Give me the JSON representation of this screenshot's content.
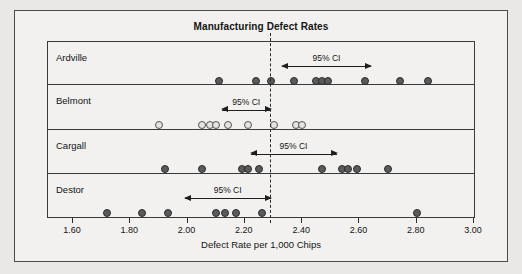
{
  "chart_data": {
    "type": "scatter",
    "title": "Manufacturing Defect Rates",
    "xlabel": "Defect Rate per 1,000 Chips",
    "ylabel": "",
    "xlim": [
      1.55,
      3.02
    ],
    "xticks": [
      "1.60",
      "1.80",
      "2.00",
      "2.20",
      "2.40",
      "2.60",
      "2.80",
      "3.00"
    ],
    "xtick_values": [
      1.6,
      1.8,
      2.0,
      2.2,
      2.4,
      2.6,
      2.8,
      3.0
    ],
    "grid": false,
    "legend": "none",
    "reference_line": {
      "label": "",
      "value": 2.29,
      "style": "dashed"
    },
    "groups": [
      {
        "name": "Ardville",
        "marker": "filled",
        "values": [
          2.11,
          2.24,
          2.29,
          2.37,
          2.45,
          2.47,
          2.49,
          2.62,
          2.74,
          2.84
        ],
        "ci_label": "95% CI",
        "ci_low": 2.33,
        "ci_high": 2.64
      },
      {
        "name": "Belmont",
        "marker": "open",
        "values": [
          1.9,
          2.05,
          2.08,
          2.1,
          2.14,
          2.21,
          2.3,
          2.38,
          2.4
        ],
        "ci_label": "95% CI",
        "ci_low": 2.12,
        "ci_high": 2.29
      },
      {
        "name": "Cargall",
        "marker": "filled",
        "values": [
          1.92,
          2.05,
          2.19,
          2.21,
          2.25,
          2.47,
          2.54,
          2.56,
          2.59,
          2.7
        ],
        "ci_label": "95% CI",
        "ci_low": 2.22,
        "ci_high": 2.52
      },
      {
        "name": "Destor",
        "marker": "filled",
        "values": [
          1.72,
          1.84,
          1.93,
          2.1,
          2.13,
          2.17,
          2.26,
          2.8
        ],
        "ci_label": "95% CI",
        "ci_low": 1.99,
        "ci_high": 2.29
      }
    ]
  },
  "colors": {
    "page_background": "#e9e8e6",
    "panel_background": "#f2f1ef",
    "frame": "#4a4a4a",
    "marker_fill": "#5a5a5a",
    "marker_edge": "#2c2c2c",
    "reference_line": "#2a2a2a",
    "text": "#141414"
  }
}
